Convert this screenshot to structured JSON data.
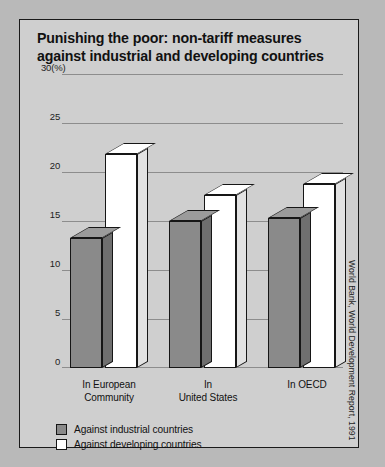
{
  "figure": {
    "title": "Punishing the poor: non-tariff measures against industrial and developing countries",
    "source": "World Bank, World Development Report, 1991"
  },
  "legend": {
    "items": [
      {
        "label": "Against industrial countries",
        "swatch": "gray"
      },
      {
        "label": "Against developing countries",
        "swatch": "white"
      }
    ]
  },
  "axis": {
    "unit_label": "30(%)",
    "ticks": [
      "30(%)",
      "25",
      "20",
      "15",
      "10",
      "5",
      "0"
    ]
  },
  "chart_data": {
    "type": "bar",
    "title": "Punishing the poor: non-tariff measures against industrial and developing countries",
    "categories": [
      "In European Community",
      "In United States",
      "In OECD"
    ],
    "category_lines": [
      [
        "In European",
        "Community"
      ],
      [
        "In",
        "United States"
      ],
      [
        "In OECD"
      ]
    ],
    "series": [
      {
        "name": "Against industrial countries",
        "values": [
          13.3,
          15.0,
          15.3
        ],
        "color": "#8a8a8a"
      },
      {
        "name": "Against developing countries",
        "values": [
          21.8,
          17.7,
          18.8
        ],
        "color": "#ffffff"
      }
    ],
    "xlabel": "",
    "ylabel": "(%)",
    "ylim": [
      0,
      30
    ],
    "ytick_values": [
      0,
      5,
      10,
      15,
      20,
      25,
      30
    ],
    "grid": true,
    "legend_position": "bottom-left",
    "style": "3d-bars"
  }
}
